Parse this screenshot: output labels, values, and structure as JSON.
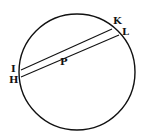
{
  "diagram": {
    "type": "geometry",
    "stroke_color": "#111111",
    "background": "#ffffff",
    "circle": {
      "cx": 77,
      "cy": 72,
      "r": 58
    },
    "points": {
      "I": {
        "label": "I",
        "x": 21,
        "y": 70
      },
      "H": {
        "label": "H",
        "x": 21,
        "y": 77
      },
      "K": {
        "label": "K",
        "x": 112,
        "y": 29
      },
      "L": {
        "label": "L",
        "x": 119,
        "y": 35
      },
      "P": {
        "label": "P",
        "x": 64,
        "y": 52
      }
    },
    "chords": [
      {
        "from": "I",
        "to": "K"
      },
      {
        "from": "H",
        "to": "L"
      }
    ],
    "labels": {
      "I": "I",
      "H": "H",
      "K": "K",
      "L": "L",
      "P": "P"
    }
  }
}
